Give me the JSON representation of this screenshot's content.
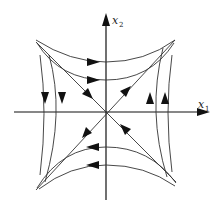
{
  "diagram": {
    "type": "phase-portrait",
    "axes": {
      "x": {
        "label": "x",
        "subscript": "1"
      },
      "y": {
        "label": "x",
        "subscript": "2"
      }
    },
    "colors": {
      "stroke": "#333333",
      "background": "#ffffff"
    },
    "trajectories": {
      "top": {
        "count": 2,
        "direction": "right"
      },
      "bottom": {
        "count": 2,
        "direction": "left"
      },
      "left": {
        "count": 2,
        "direction": "down"
      },
      "right": {
        "count": 2,
        "direction": "up"
      },
      "diagonals": [
        {
          "name": "upper-left",
          "direction": "toward-origin"
        },
        {
          "name": "upper-right",
          "direction": "away-from-origin"
        },
        {
          "name": "lower-left",
          "direction": "away-from-origin"
        },
        {
          "name": "lower-right",
          "direction": "toward-origin"
        }
      ]
    }
  }
}
